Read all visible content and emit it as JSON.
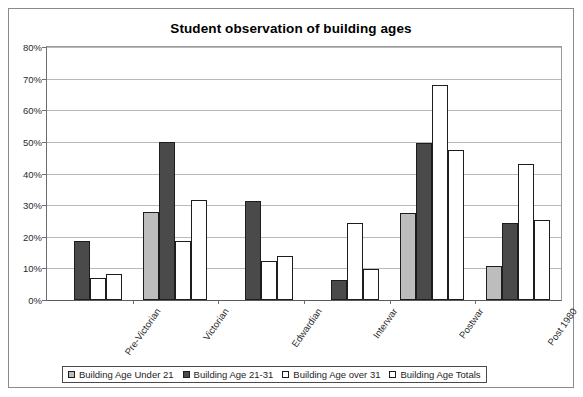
{
  "chart_data": {
    "type": "bar",
    "title": "Student observation of building ages",
    "xlabel": "",
    "ylabel": "",
    "ylim": [
      0,
      80
    ],
    "ytick_labels": [
      "0%",
      "10%",
      "20%",
      "30%",
      "40%",
      "50%",
      "60%",
      "70%",
      "80%"
    ],
    "ytick_values": [
      0,
      10,
      20,
      30,
      40,
      50,
      60,
      70,
      80
    ],
    "grid": true,
    "legend_position": "bottom",
    "categories": [
      "Pre-Victorian",
      "Victorian",
      "Edwardian",
      "Interwar",
      "Postwar",
      "Post 1980"
    ],
    "series": [
      {
        "name": "Building Age  Under 21",
        "color": "#bdbdbd",
        "values": [
          0,
          27.8,
          0,
          0,
          27.4,
          10.6
        ]
      },
      {
        "name": "Building Age  21-31",
        "color": "#4a4a4a",
        "values": [
          18.8,
          50.0,
          31.2,
          6.2,
          49.6,
          24.4
        ]
      },
      {
        "name": "Building Age  over 31",
        "color": "#ffffff",
        "values": [
          6.9,
          18.6,
          12.4,
          24.5,
          68.1,
          43.1
        ]
      },
      {
        "name": "Building Age  Totals",
        "color": "#ffffff",
        "values": [
          8.1,
          31.6,
          14.0,
          9.8,
          47.5,
          25.3
        ]
      }
    ]
  },
  "legend": {
    "items": [
      {
        "label": "Building Age  Under 21"
      },
      {
        "label": "Building Age  21-31"
      },
      {
        "label": "Building Age  over 31"
      },
      {
        "label": "Building Age  Totals"
      }
    ]
  }
}
